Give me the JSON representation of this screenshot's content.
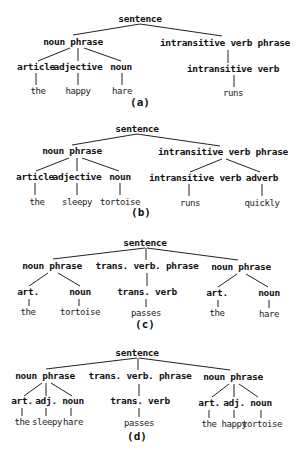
{
  "figure": {
    "trees": [
      {
        "caption": "(a)",
        "caption_pos": [
          140,
          106
        ],
        "nodes": [
          {
            "id": "s",
            "label": "sentence",
            "type": "node",
            "x": 140,
            "y": 22
          },
          {
            "id": "np",
            "label": "noun phrase",
            "type": "node",
            "x": 73,
            "y": 45
          },
          {
            "id": "ivp",
            "label": "intransitive verb phrase",
            "type": "node",
            "x": 225,
            "y": 46
          },
          {
            "id": "art",
            "label": "article",
            "type": "node",
            "x": 36,
            "y": 70
          },
          {
            "id": "adj",
            "label": "adjective",
            "type": "node",
            "x": 78,
            "y": 70
          },
          {
            "id": "n",
            "label": "noun",
            "type": "node",
            "x": 121,
            "y": 70
          },
          {
            "id": "iv",
            "label": "intransitive verb",
            "type": "node",
            "x": 233,
            "y": 72
          },
          {
            "id": "w1",
            "label": "the",
            "type": "leaf",
            "x": 38,
            "y": 94
          },
          {
            "id": "w2",
            "label": "happy",
            "type": "leaf",
            "x": 78,
            "y": 94
          },
          {
            "id": "w3",
            "label": "hare",
            "type": "leaf",
            "x": 122,
            "y": 94
          },
          {
            "id": "w4",
            "label": "runs",
            "type": "leaf",
            "x": 233,
            "y": 96
          }
        ],
        "edges": [
          {
            "x1": 140,
            "y1": 24,
            "x2": 73,
            "y2": 35
          },
          {
            "x1": 140,
            "y1": 24,
            "x2": 222,
            "y2": 36
          },
          {
            "x1": 70,
            "y1": 48,
            "x2": 38,
            "y2": 61
          },
          {
            "x1": 78,
            "y1": 48,
            "x2": 78,
            "y2": 61
          },
          {
            "x1": 84,
            "y1": 48,
            "x2": 121,
            "y2": 61
          },
          {
            "x1": 228,
            "y1": 50,
            "x2": 228,
            "y2": 63
          },
          {
            "x1": 36,
            "y1": 73,
            "x2": 36,
            "y2": 85
          },
          {
            "x1": 78,
            "y1": 73,
            "x2": 78,
            "y2": 85
          },
          {
            "x1": 122,
            "y1": 73,
            "x2": 122,
            "y2": 85
          },
          {
            "x1": 234,
            "y1": 75,
            "x2": 234,
            "y2": 87
          }
        ]
      },
      {
        "caption": "(b)",
        "caption_pos": [
          141,
          216
        ],
        "nodes": [
          {
            "id": "s",
            "label": "sentence",
            "type": "node",
            "x": 137,
            "y": 132
          },
          {
            "id": "np",
            "label": "noun phrase",
            "type": "node",
            "x": 72,
            "y": 154
          },
          {
            "id": "ivp",
            "label": "intransitive verb phrase",
            "type": "node",
            "x": 223,
            "y": 155
          },
          {
            "id": "art",
            "label": "article",
            "type": "node",
            "x": 35,
            "y": 180
          },
          {
            "id": "adj",
            "label": "adjective",
            "type": "node",
            "x": 77,
            "y": 180
          },
          {
            "id": "n",
            "label": "noun",
            "type": "node",
            "x": 120,
            "y": 180
          },
          {
            "id": "iv",
            "label": "intransitive verb",
            "type": "node",
            "x": 195,
            "y": 181
          },
          {
            "id": "adv",
            "label": "adverb",
            "type": "node",
            "x": 262,
            "y": 181
          },
          {
            "id": "w1",
            "label": "the",
            "type": "leaf",
            "x": 37,
            "y": 205
          },
          {
            "id": "w2",
            "label": "sleepy",
            "type": "leaf",
            "x": 77,
            "y": 205
          },
          {
            "id": "w3",
            "label": "tortoise",
            "type": "leaf",
            "x": 120,
            "y": 205
          },
          {
            "id": "w4",
            "label": "runs",
            "type": "leaf",
            "x": 190,
            "y": 206
          },
          {
            "id": "w5",
            "label": "quickly",
            "type": "leaf",
            "x": 262,
            "y": 206
          }
        ],
        "edges": [
          {
            "x1": 137,
            "y1": 134,
            "x2": 72,
            "y2": 145
          },
          {
            "x1": 137,
            "y1": 134,
            "x2": 220,
            "y2": 146
          },
          {
            "x1": 69,
            "y1": 158,
            "x2": 36,
            "y2": 171
          },
          {
            "x1": 77,
            "y1": 158,
            "x2": 77,
            "y2": 171
          },
          {
            "x1": 82,
            "y1": 158,
            "x2": 119,
            "y2": 171
          },
          {
            "x1": 222,
            "y1": 159,
            "x2": 190,
            "y2": 172
          },
          {
            "x1": 226,
            "y1": 159,
            "x2": 260,
            "y2": 172
          },
          {
            "x1": 35,
            "y1": 183,
            "x2": 35,
            "y2": 195
          },
          {
            "x1": 77,
            "y1": 183,
            "x2": 77,
            "y2": 195
          },
          {
            "x1": 120,
            "y1": 183,
            "x2": 120,
            "y2": 195
          },
          {
            "x1": 189,
            "y1": 184,
            "x2": 189,
            "y2": 196
          },
          {
            "x1": 262,
            "y1": 184,
            "x2": 262,
            "y2": 196
          }
        ]
      },
      {
        "caption": "(c)",
        "caption_pos": [
          145,
          328
        ],
        "nodes": [
          {
            "id": "s",
            "label": "sentence",
            "type": "node",
            "x": 145,
            "y": 246
          },
          {
            "id": "np1",
            "label": "noun phrase",
            "type": "node",
            "x": 52,
            "y": 269
          },
          {
            "id": "tvp",
            "label": "trans. verb. phrase",
            "type": "node",
            "x": 147,
            "y": 269
          },
          {
            "id": "np2",
            "label": "noun phrase",
            "type": "node",
            "x": 241,
            "y": 270
          },
          {
            "id": "art1",
            "label": "art.",
            "type": "node",
            "x": 28,
            "y": 295
          },
          {
            "id": "n1",
            "label": "noun",
            "type": "node",
            "x": 80,
            "y": 295
          },
          {
            "id": "tv",
            "label": "trans. verb",
            "type": "node",
            "x": 147,
            "y": 295
          },
          {
            "id": "art2",
            "label": "art.",
            "type": "node",
            "x": 217,
            "y": 296
          },
          {
            "id": "n2",
            "label": "noun",
            "type": "node",
            "x": 269,
            "y": 296
          },
          {
            "id": "w1",
            "label": "the",
            "type": "leaf",
            "x": 28,
            "y": 315
          },
          {
            "id": "w2",
            "label": "tortoise",
            "type": "leaf",
            "x": 80,
            "y": 315
          },
          {
            "id": "w3",
            "label": "passes",
            "type": "leaf",
            "x": 146,
            "y": 316
          },
          {
            "id": "w4",
            "label": "the",
            "type": "leaf",
            "x": 217,
            "y": 316
          },
          {
            "id": "w5",
            "label": "hare",
            "type": "leaf",
            "x": 269,
            "y": 317
          }
        ],
        "edges": [
          {
            "x1": 145,
            "y1": 248,
            "x2": 53,
            "y2": 259
          },
          {
            "x1": 146,
            "y1": 248,
            "x2": 146,
            "y2": 260
          },
          {
            "x1": 147,
            "y1": 248,
            "x2": 238,
            "y2": 260
          },
          {
            "x1": 48,
            "y1": 273,
            "x2": 29,
            "y2": 286
          },
          {
            "x1": 58,
            "y1": 273,
            "x2": 80,
            "y2": 286
          },
          {
            "x1": 147,
            "y1": 273,
            "x2": 147,
            "y2": 286
          },
          {
            "x1": 237,
            "y1": 274,
            "x2": 218,
            "y2": 287
          },
          {
            "x1": 246,
            "y1": 274,
            "x2": 268,
            "y2": 287
          },
          {
            "x1": 29,
            "y1": 299,
            "x2": 29,
            "y2": 306
          },
          {
            "x1": 79,
            "y1": 299,
            "x2": 79,
            "y2": 306
          },
          {
            "x1": 146,
            "y1": 299,
            "x2": 146,
            "y2": 307
          },
          {
            "x1": 218,
            "y1": 300,
            "x2": 218,
            "y2": 307
          },
          {
            "x1": 269,
            "y1": 300,
            "x2": 269,
            "y2": 308
          }
        ]
      },
      {
        "caption": "(d)",
        "caption_pos": [
          137,
          440
        ],
        "nodes": [
          {
            "id": "s",
            "label": "sentence",
            "type": "node",
            "x": 137,
            "y": 356
          },
          {
            "id": "np1",
            "label": "noun phrase",
            "type": "node",
            "x": 45,
            "y": 379
          },
          {
            "id": "tvp",
            "label": "trans. verb. phrase",
            "type": "node",
            "x": 140,
            "y": 379
          },
          {
            "id": "np2",
            "label": "noun phrase",
            "type": "node",
            "x": 233,
            "y": 380
          },
          {
            "id": "art1",
            "label": "art.",
            "type": "node",
            "x": 22,
            "y": 404
          },
          {
            "id": "adj1",
            "label": "adj.",
            "type": "node",
            "x": 46,
            "y": 404
          },
          {
            "id": "n1",
            "label": "noun",
            "type": "node",
            "x": 73,
            "y": 404
          },
          {
            "id": "tv",
            "label": "trans. verb",
            "type": "node",
            "x": 140,
            "y": 404
          },
          {
            "id": "art2",
            "label": "art.",
            "type": "node",
            "x": 209,
            "y": 406
          },
          {
            "id": "adj2",
            "label": "adj.",
            "type": "node",
            "x": 234,
            "y": 406
          },
          {
            "id": "n2",
            "label": "noun",
            "type": "node",
            "x": 261,
            "y": 406
          },
          {
            "id": "w1",
            "label": "the",
            "type": "leaf",
            "x": 22,
            "y": 425
          },
          {
            "id": "w2",
            "label": "sleepy",
            "type": "leaf",
            "x": 47,
            "y": 425
          },
          {
            "id": "w3",
            "label": "hare",
            "type": "leaf",
            "x": 73,
            "y": 425
          },
          {
            "id": "w4",
            "label": "passes",
            "type": "leaf",
            "x": 139,
            "y": 426
          },
          {
            "id": "w5",
            "label": "the",
            "type": "leaf",
            "x": 209,
            "y": 427
          },
          {
            "id": "w6",
            "label": "happy",
            "type": "leaf",
            "x": 234,
            "y": 427
          },
          {
            "id": "w7",
            "label": "tortoise",
            "type": "leaf",
            "x": 262,
            "y": 427
          }
        ],
        "edges": [
          {
            "x1": 137,
            "y1": 358,
            "x2": 46,
            "y2": 369
          },
          {
            "x1": 138,
            "y1": 358,
            "x2": 138,
            "y2": 370
          },
          {
            "x1": 139,
            "y1": 358,
            "x2": 230,
            "y2": 370
          },
          {
            "x1": 42,
            "y1": 383,
            "x2": 24,
            "y2": 396
          },
          {
            "x1": 46,
            "y1": 383,
            "x2": 46,
            "y2": 396
          },
          {
            "x1": 51,
            "y1": 383,
            "x2": 72,
            "y2": 396
          },
          {
            "x1": 139,
            "y1": 384,
            "x2": 139,
            "y2": 396
          },
          {
            "x1": 229,
            "y1": 384,
            "x2": 212,
            "y2": 397
          },
          {
            "x1": 234,
            "y1": 384,
            "x2": 234,
            "y2": 397
          },
          {
            "x1": 239,
            "y1": 384,
            "x2": 258,
            "y2": 397
          },
          {
            "x1": 22,
            "y1": 408,
            "x2": 22,
            "y2": 416
          },
          {
            "x1": 46,
            "y1": 408,
            "x2": 46,
            "y2": 416
          },
          {
            "x1": 71,
            "y1": 408,
            "x2": 71,
            "y2": 416
          },
          {
            "x1": 139,
            "y1": 408,
            "x2": 139,
            "y2": 417
          },
          {
            "x1": 209,
            "y1": 410,
            "x2": 209,
            "y2": 418
          },
          {
            "x1": 234,
            "y1": 410,
            "x2": 234,
            "y2": 418
          },
          {
            "x1": 261,
            "y1": 410,
            "x2": 261,
            "y2": 418
          }
        ]
      }
    ]
  }
}
